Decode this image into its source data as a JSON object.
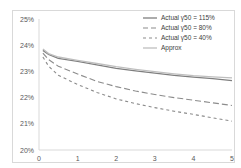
{
  "chart_data": {
    "type": "line",
    "title": "",
    "xlabel": "",
    "ylabel": "",
    "xlim": [
      0,
      5
    ],
    "ylim": [
      20,
      25
    ],
    "x_ticks": [
      "0",
      "1",
      "2",
      "3",
      "4",
      "5"
    ],
    "y_ticks": [
      "20%",
      "21%",
      "22%",
      "23%",
      "24%",
      "25%"
    ],
    "grid": false,
    "legend_position": "upper right",
    "x": [
      0.1,
      0.25,
      0.5,
      1,
      1.5,
      2,
      2.5,
      3,
      3.5,
      4,
      4.5,
      5
    ],
    "series": [
      {
        "name": "Actual γ50 = 115%",
        "style": "solid",
        "color": "#7f7f7f",
        "values": [
          23.8,
          23.65,
          23.5,
          23.38,
          23.25,
          23.12,
          23.02,
          22.93,
          22.85,
          22.78,
          22.72,
          22.65
        ]
      },
      {
        "name": "Actual γ50 = 80%",
        "style": "long-dash",
        "color": "#8c8c8c",
        "values": [
          23.7,
          23.45,
          23.2,
          22.9,
          22.62,
          22.42,
          22.25,
          22.12,
          22.0,
          21.9,
          21.8,
          21.7
        ]
      },
      {
        "name": "Actual γ50 = 40%",
        "style": "short-dash",
        "color": "#8c8c8c",
        "values": [
          23.55,
          23.2,
          22.85,
          22.5,
          22.2,
          21.95,
          21.77,
          21.62,
          21.48,
          21.36,
          21.23,
          21.1
        ]
      },
      {
        "name": "Approx",
        "style": "solid",
        "color": "#bfbfbf",
        "values": [
          23.85,
          23.68,
          23.55,
          23.42,
          23.3,
          23.18,
          23.08,
          22.99,
          22.91,
          22.84,
          22.79,
          22.75
        ]
      }
    ]
  },
  "legend": {
    "items": [
      {
        "label": "Actual γ50 = 115%"
      },
      {
        "label": "Actual γ50 = 80%"
      },
      {
        "label": "Actual γ50 = 40%"
      },
      {
        "label": "Approx"
      }
    ]
  }
}
